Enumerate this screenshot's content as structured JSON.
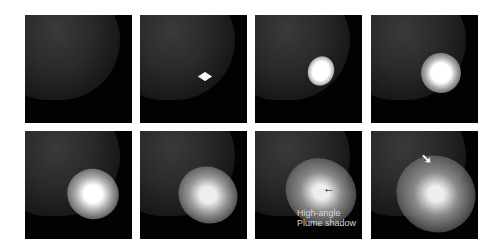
{
  "figure": {
    "frames": [
      {
        "index": 1,
        "row": 1,
        "col": 1,
        "flash": "none"
      },
      {
        "index": 2,
        "row": 1,
        "col": 2,
        "flash": "initial-flash"
      },
      {
        "index": 3,
        "row": 1,
        "col": 3,
        "flash": "bright-plume"
      },
      {
        "index": 4,
        "row": 1,
        "col": 4,
        "flash": "expanding-plume"
      },
      {
        "index": 5,
        "row": 2,
        "col": 1,
        "flash": "expanding-plume"
      },
      {
        "index": 6,
        "row": 2,
        "col": 2,
        "flash": "diffuse-plume"
      },
      {
        "index": 7,
        "row": 2,
        "col": 3,
        "flash": "diffuse-plume"
      },
      {
        "index": 8,
        "row": 2,
        "col": 4,
        "flash": "diffuse-plume"
      }
    ],
    "annotations": {
      "frame7_label_line1": "High-angle",
      "frame7_label_line2": "Plume shadow",
      "frame7_arrow": "←",
      "frame8_arrow": "➘"
    }
  }
}
